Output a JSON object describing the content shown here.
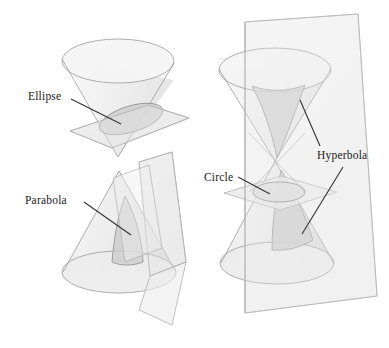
{
  "figure": {
    "background_color": "#ffffff",
    "line_color": "#8a8a8a",
    "leader_color": "#333333",
    "cone_fill": "#eeeeee",
    "plane_fill": "#e9e9e9",
    "cross_section_fill": "#d2d2d2"
  },
  "labels": {
    "ellipse": "Ellipse",
    "parabola": "Parabola",
    "circle": "Circle",
    "hyperbola": "Hyperbola"
  },
  "diagram_data": {
    "type": "geometric-illustration",
    "subject": "conic sections",
    "panels": [
      {
        "name": "ellipse-panel",
        "conic": "Ellipse",
        "cone": "single inverted nappe, apex at bottom",
        "plane": "oblique plane cutting across the cone",
        "cross_section_shape": "ellipse"
      },
      {
        "name": "parabola-panel",
        "conic": "Parabola",
        "cone": "single upright nappe, apex at top",
        "plane": "plane parallel to a generating line",
        "cross_section_shape": "parabola"
      },
      {
        "name": "circle-hyperbola-panel",
        "conic": "Circle and Hyperbola",
        "cone": "double nappe, apexes meeting in the middle",
        "plane_horizontal": "horizontal plane perpendicular to the axis producing a circle",
        "plane_vertical": "vertical plane parallel to the axis producing a hyperbola",
        "cross_section_shapes": [
          "circle",
          "hyperbola"
        ]
      }
    ]
  }
}
